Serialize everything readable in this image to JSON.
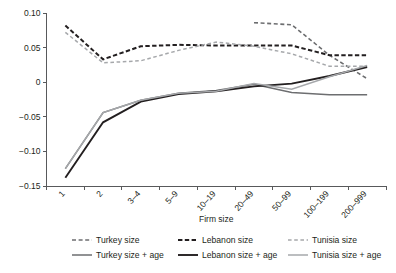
{
  "chart_data": {
    "type": "line",
    "title": "",
    "xlabel": "Firm size",
    "ylabel": "",
    "categories": [
      "1",
      "2",
      "3–4",
      "5–9",
      "10–19",
      "20–49",
      "50–99",
      "100–199",
      "200–999"
    ],
    "yticks": [
      "0.10",
      "0.05",
      "0",
      "−0.05",
      "−0.10",
      "−0.15"
    ],
    "ytick_values": [
      0.1,
      0.05,
      0,
      -0.05,
      -0.1,
      -0.15
    ],
    "ylim": [
      -0.15,
      0.1
    ],
    "grid": false,
    "legend_position": "bottom",
    "series": [
      {
        "name": "Turkey size",
        "style": "dashed",
        "color": "#6d6e70",
        "width": 1.6,
        "dash": "4,2.6",
        "x": [
          "20–49",
          "50–99",
          "100–199",
          "200–999"
        ],
        "values": [
          0.086,
          0.083,
          0.039,
          0.005
        ]
      },
      {
        "name": "Lebanon size",
        "style": "dashed",
        "color": "#231f20",
        "width": 2.0,
        "dash": "4.4,2.4",
        "x": [
          "1",
          "2",
          "3–4",
          "5–9",
          "10–19",
          "20–49",
          "50–99",
          "100–199",
          "200–999"
        ],
        "values": [
          0.082,
          0.033,
          0.052,
          0.054,
          0.053,
          0.053,
          0.053,
          0.039,
          0.039
        ]
      },
      {
        "name": "Tunisia size",
        "style": "dashed",
        "color": "#a6a8ab",
        "width": 1.5,
        "dash": "3.6,2.6",
        "x": [
          "1",
          "2",
          "3–4",
          "5–9",
          "10–19",
          "20–49",
          "50–99",
          "100–199",
          "200–999"
        ],
        "values": [
          0.072,
          0.028,
          0.031,
          0.046,
          0.058,
          0.052,
          0.041,
          0.023,
          0.023
        ]
      },
      {
        "name": "Turkey size + age",
        "style": "solid",
        "color": "#6d6e70",
        "width": 1.5,
        "dash": "",
        "x": [
          "1",
          "2",
          "3–4",
          "5–9",
          "10–19",
          "20–49",
          "50–99",
          "100–199",
          "200–999"
        ],
        "values": [
          -0.125,
          -0.044,
          -0.026,
          -0.016,
          -0.012,
          -0.003,
          -0.015,
          -0.018,
          -0.018
        ]
      },
      {
        "name": "Lebanon size + age",
        "style": "solid",
        "color": "#231f20",
        "width": 1.9,
        "dash": "",
        "x": [
          "1",
          "2",
          "3–4",
          "5–9",
          "10–19",
          "20–49",
          "50–99",
          "100–199",
          "200–999"
        ],
        "values": [
          -0.138,
          -0.058,
          -0.028,
          -0.017,
          -0.013,
          -0.006,
          -0.002,
          0.009,
          0.022
        ]
      },
      {
        "name": "Tunisia size + age",
        "style": "solid",
        "color": "#a6a8ab",
        "width": 1.5,
        "dash": "",
        "x": [
          "1",
          "2",
          "3–4",
          "5–9",
          "10–19",
          "20–49",
          "50–99",
          "100–199",
          "200–999"
        ],
        "values": [
          -0.125,
          -0.044,
          -0.026,
          -0.016,
          -0.013,
          -0.002,
          -0.01,
          0.008,
          0.024
        ]
      }
    ]
  },
  "legend": {
    "items": [
      {
        "label": "Turkey size",
        "key": "Turkey size"
      },
      {
        "label": "Lebanon size",
        "key": "Lebanon size"
      },
      {
        "label": "Tunisia size",
        "key": "Tunisia size"
      },
      {
        "label": "Turkey size + age",
        "key": "Turkey size + age"
      },
      {
        "label": "Lebanon size + age",
        "key": "Lebanon size + age"
      },
      {
        "label": "Tunisia size + age",
        "key": "Tunisia size + age"
      }
    ]
  }
}
